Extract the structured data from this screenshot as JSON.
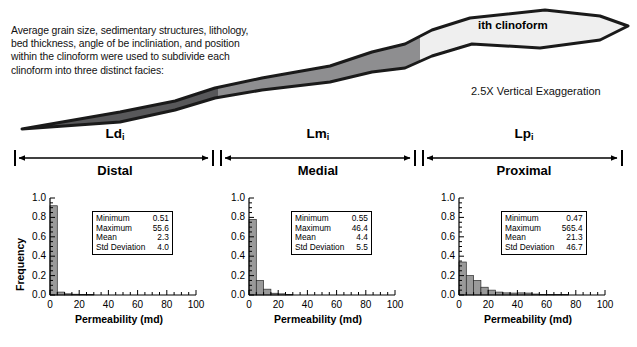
{
  "caption": {
    "lines": [
      "Average grain size, sedimentary structures, lithology,",
      "bed thickness, angle of be incliniation, and position",
      "within the clinoform were used to subdivide each",
      "clinoform into three  distinct facies:"
    ]
  },
  "clinoform": {
    "title": "ith clinoform",
    "vertical_exaggeration": "2.5X Vertical Exaggeration",
    "zones": [
      {
        "id": "distal",
        "fill": "#58585a"
      },
      {
        "id": "medial",
        "fill": "#8e8e90"
      },
      {
        "id": "proximal",
        "fill": "#efefef"
      }
    ],
    "outline_color": "#1a1a1a"
  },
  "facies_spans": [
    {
      "code": "Ld",
      "sub": "i",
      "name": "Distal"
    },
    {
      "code": "Lm",
      "sub": "i",
      "name": "Medial"
    },
    {
      "code": "Lp",
      "sub": "i",
      "name": "Proximal"
    }
  ],
  "histograms": [
    {
      "id": "distal",
      "ylabel": "Frequency",
      "show_ylabel": true,
      "xlabel": "Permeability  (md)",
      "yticks": [
        "0.0",
        "0.2",
        "0.4",
        "0.6",
        "0.8",
        "1.0"
      ],
      "xticks": [
        "0",
        "20",
        "40",
        "60",
        "80",
        "100"
      ],
      "stats": [
        {
          "key": "Minimum",
          "value": "0.51"
        },
        {
          "key": "Maximum",
          "value": "55.6"
        },
        {
          "key": "Mean",
          "value": "2.3"
        },
        {
          "key": "Std Deviation",
          "value": "4.0"
        }
      ],
      "chart_data": {
        "type": "bar",
        "title": "",
        "xlabel": "Permeability  (md)",
        "ylabel": "Frequency",
        "xlim": [
          0,
          100
        ],
        "ylim": [
          0.0,
          1.0
        ],
        "bin_width": 5,
        "bin_starts": [
          0,
          5,
          10,
          15,
          20,
          25,
          30,
          35,
          40,
          45,
          50,
          55
        ],
        "values": [
          0.92,
          0.03,
          0.012,
          0.008,
          0.004,
          0.006,
          0.0,
          0.0,
          0.0,
          0.0,
          0.0,
          0.003
        ],
        "grid": false,
        "bar_fill": "#9a9a9a"
      }
    },
    {
      "id": "medial",
      "ylabel": "Frequency",
      "show_ylabel": false,
      "xlabel": "Permeability  (md)",
      "yticks": [
        "0.0",
        "0.2",
        "0.4",
        "0.6",
        "0.8",
        "1.0"
      ],
      "xticks": [
        "0",
        "20",
        "40",
        "60",
        "80",
        "100"
      ],
      "stats": [
        {
          "key": "Minimum",
          "value": "0.55"
        },
        {
          "key": "Maximum",
          "value": "46.4"
        },
        {
          "key": "Mean",
          "value": "4.4"
        },
        {
          "key": "Std Deviation",
          "value": "5.5"
        }
      ],
      "chart_data": {
        "type": "bar",
        "title": "",
        "xlabel": "Permeability  (md)",
        "ylabel": "Frequency",
        "xlim": [
          0,
          100
        ],
        "ylim": [
          0.0,
          1.0
        ],
        "bin_width": 5,
        "bin_starts": [
          0,
          5,
          10,
          15,
          20,
          25,
          30,
          35,
          40,
          45
        ],
        "values": [
          0.78,
          0.15,
          0.06,
          0.018,
          0.012,
          0.004,
          0.0,
          0.0,
          0.0,
          0.003
        ],
        "grid": false,
        "bar_fill": "#9a9a9a"
      }
    },
    {
      "id": "proximal",
      "ylabel": "Frequency",
      "show_ylabel": false,
      "xlabel": "Permeability  (md)",
      "yticks": [
        "0.0",
        "0.2",
        "0.4",
        "0.6",
        "0.8",
        "1.0"
      ],
      "xticks": [
        "0",
        "20",
        "40",
        "60",
        "80",
        "100"
      ],
      "stats": [
        {
          "key": "Minimum",
          "value": "0.47"
        },
        {
          "key": "Maximum",
          "value": "565.4"
        },
        {
          "key": "Mean",
          "value": "21.3"
        },
        {
          "key": "Std Deviation",
          "value": "46.7"
        }
      ],
      "chart_data": {
        "type": "bar",
        "title": "",
        "xlabel": "Permeability  (md)",
        "ylabel": "Frequency",
        "xlim": [
          0,
          100
        ],
        "ylim": [
          0.0,
          1.0
        ],
        "bin_width": 5,
        "bin_starts": [
          0,
          5,
          10,
          15,
          20,
          25,
          30,
          35,
          40,
          45,
          50,
          55,
          60,
          65,
          70,
          75,
          80,
          85,
          90,
          95
        ],
        "values": [
          0.34,
          0.2,
          0.15,
          0.08,
          0.05,
          0.03,
          0.022,
          0.02,
          0.022,
          0.02,
          0.01,
          0.006,
          0.006,
          0.004,
          0.004,
          0.003,
          0.003,
          0.002,
          0.002,
          0.002
        ],
        "grid": false,
        "bar_fill": "#9a9a9a"
      }
    }
  ]
}
